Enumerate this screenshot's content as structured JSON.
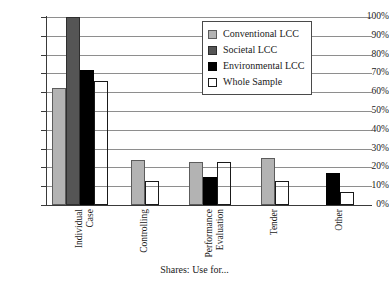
{
  "chart_data": {
    "type": "bar",
    "title": "",
    "xlabel": "Shares: Use for...",
    "ylabel": "",
    "ylim": [
      0,
      100
    ],
    "grid": true,
    "legend_position": "top-right",
    "categories": [
      "Individual Case",
      "Controlling",
      "Performance Evaluation",
      "Tender",
      "Other"
    ],
    "ytick_labels": [
      "100%",
      "90%",
      "80%",
      "70%",
      "60%",
      "50%",
      "40%",
      "30%",
      "20%",
      "10%",
      "0%"
    ],
    "ytick_values": [
      100,
      90,
      80,
      70,
      60,
      50,
      40,
      30,
      20,
      10,
      0
    ],
    "series": [
      {
        "name": "Conventional LCC",
        "color": "#b3b3b3",
        "values": [
          62,
          24,
          23,
          25,
          0
        ]
      },
      {
        "name": "Societal LCC",
        "color": "#555555",
        "values": [
          100,
          0,
          0,
          0,
          0
        ]
      },
      {
        "name": "Environmental LCC",
        "color": "#000000",
        "values": [
          72,
          0,
          15,
          0,
          17
        ]
      },
      {
        "name": "Whole Sample",
        "color": "#ffffff",
        "values": [
          66,
          13,
          23,
          13,
          7
        ]
      }
    ]
  },
  "categories_display": [
    {
      "line1": "Individual",
      "line2": "Case"
    },
    {
      "line1": "Controlling",
      "line2": ""
    },
    {
      "line1": "Performance",
      "line2": "Evaluation"
    },
    {
      "line1": "Tender",
      "line2": ""
    },
    {
      "line1": "Other",
      "line2": ""
    }
  ]
}
